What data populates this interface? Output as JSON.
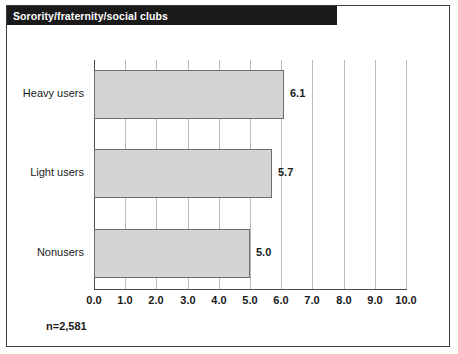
{
  "title": "Sorority/fraternity/social clubs",
  "sample_note": "n=2,581",
  "colors": {
    "title_bar_bg": "#1a1a1a",
    "title_text": "#ffffff",
    "bar_fill": "#d4d4d4",
    "bar_stroke": "#6e6e6e",
    "gridline": "#b9b9b9",
    "axis": "#4a4a4a",
    "frame": "#3b3b3b"
  },
  "chart_data": {
    "type": "bar",
    "orientation": "horizontal",
    "title": "Sorority/fraternity/social clubs",
    "categories": [
      "Heavy users",
      "Light users",
      "Nonusers"
    ],
    "values": [
      6.1,
      5.7,
      5.0
    ],
    "data_labels": [
      "6.1",
      "5.7",
      "5.0"
    ],
    "xlabel": "",
    "ylabel": "",
    "xlim": [
      0,
      10
    ],
    "xticks": [
      0,
      1,
      2,
      3,
      4,
      5,
      6,
      7,
      8,
      9,
      10
    ],
    "xtick_labels": [
      "0.0",
      "1.0",
      "2.0",
      "3.0",
      "4.0",
      "5.0",
      "6.0",
      "7.0",
      "8.0",
      "9.0",
      "10.0"
    ],
    "grid": true,
    "grid_axis": "x",
    "legend": null,
    "annotations": [
      "n=2,581"
    ]
  }
}
